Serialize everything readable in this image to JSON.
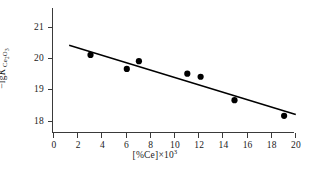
{
  "chart_data": {
    "type": "scatter",
    "title": "",
    "subtitle": "",
    "xlabel": "[%Ce]×10³",
    "ylabel": "−lgK′(Ce₂O₃)",
    "ylabel_parts": {
      "minus": "−",
      "lg": "lg",
      "symbol": "K",
      "prime": "′",
      "subscript": "Ce₂O₃"
    },
    "xlabel_parts": {
      "bracket_open": "[",
      "percent_species": "%Ce",
      "bracket_close": "]",
      "times": "×",
      "base": "10",
      "exponent": "3"
    },
    "xlim": [
      0,
      20
    ],
    "ylim": [
      17.6,
      21.6
    ],
    "xticks": [
      0,
      2,
      4,
      6,
      8,
      10,
      12,
      14,
      16,
      18,
      20
    ],
    "xtick_labels": [
      "0",
      "2",
      "4",
      "6",
      "8",
      "10",
      "12",
      "14",
      "16",
      "18",
      "20"
    ],
    "yticks": [
      18,
      19,
      20,
      21
    ],
    "ytick_labels": [
      "18",
      "19",
      "20",
      "21"
    ],
    "grid": false,
    "legend": null,
    "series": [
      {
        "name": "measured",
        "marker": "filled-circle",
        "color": "#000000",
        "points": [
          {
            "x": 3.1,
            "y": 20.1
          },
          {
            "x": 6.1,
            "y": 19.65
          },
          {
            "x": 7.1,
            "y": 19.9
          },
          {
            "x": 11.1,
            "y": 19.5
          },
          {
            "x": 12.2,
            "y": 19.4
          },
          {
            "x": 15.0,
            "y": 18.65
          },
          {
            "x": 19.1,
            "y": 18.15
          }
        ]
      },
      {
        "name": "fit-line",
        "marker": "none",
        "color": "#000000",
        "line": {
          "x1": 1.4,
          "y1": 20.4,
          "x2": 20.0,
          "y2": 18.2
        }
      }
    ],
    "axis_color": "#3a3a3a",
    "marker_color": "#000000",
    "line_color": "#000000",
    "background": "#ffffff"
  }
}
